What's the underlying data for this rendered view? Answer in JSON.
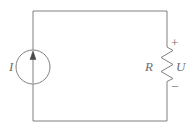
{
  "figure": {
    "name": "single-loop-circuit",
    "background_color": "#ffffff",
    "line_color": "#808080",
    "label_color": "#6e6e6e",
    "line_width": 1
  },
  "labels": {
    "current_source": "I",
    "resistor": "R",
    "voltage": "U",
    "polarity_positive": "+",
    "polarity_negative": "−"
  },
  "components": [
    {
      "id": "current-source",
      "type": "current-source",
      "symbol": "circle-with-arrow",
      "label": "I",
      "arrow_direction": "up",
      "center_x": 33,
      "center_y": 67,
      "radius": 17
    },
    {
      "id": "resistor",
      "type": "resistor",
      "symbol": "zigzag",
      "label": "R",
      "voltage_label": "U",
      "orientation": "vertical",
      "center_x": 167,
      "top_y": 44,
      "bottom_y": 84,
      "zigzag_amplitude": 6,
      "zigzag_segments": 7
    }
  ],
  "wires": {
    "loop_left_x": 33,
    "loop_right_x": 167,
    "loop_top_y": 11,
    "loop_bottom_y": 121
  }
}
